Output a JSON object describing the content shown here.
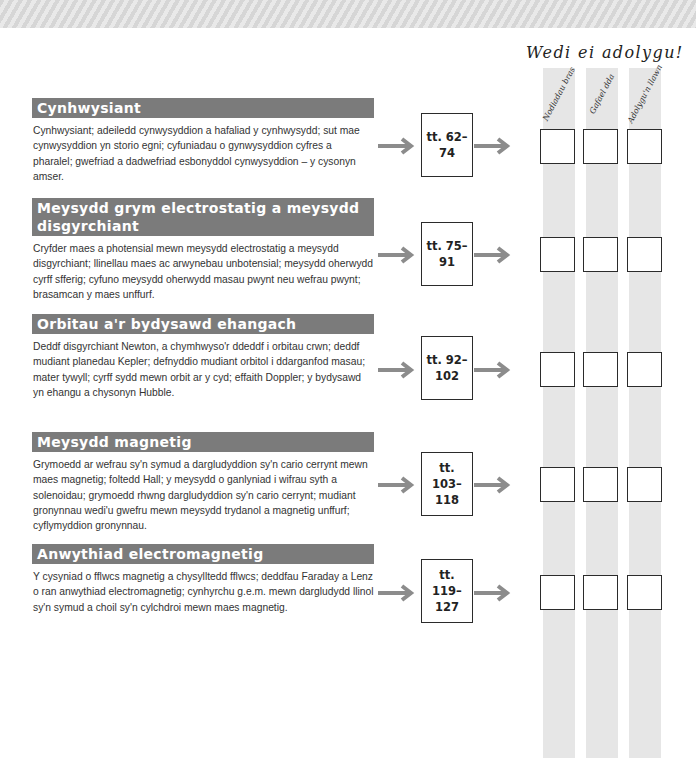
{
  "header": {
    "revised_title": "Wedi ei adolygu!",
    "columns": [
      {
        "label": "Nodiadau bras"
      },
      {
        "label": "Gafael dda"
      },
      {
        "label": "Adolygu'n llawn"
      }
    ]
  },
  "colors": {
    "section_header_bg": "#7b7b7b",
    "arrow": "#8c8c8c",
    "column_stripe": "#e6e6e6"
  },
  "sections": [
    {
      "title": "Cynhwysiant",
      "body": "Cynhwysiant; adeiledd cynwysyddion a hafaliad y cynhwysydd; sut mae cynwysyddion yn storio egni; cyfuniadau o gynwysyddion cyfres a pharalel; gwefriad a dadwefriad esbonyddol cynwysyddion – y cysonyn amser.",
      "pages": "tt. 62–74",
      "pages_line1": "tt. 62–",
      "pages_line2": "74"
    },
    {
      "title": "Meysydd grym electrostatig a meysydd disgyrchiant",
      "body": "Cryfder maes a photensial mewn meysydd electrostatig a meysydd disgyrchiant; llinellau maes ac arwynebau unbotensial; meysydd oherwydd cyrff sfferig; cyfuno meysydd oherwydd masau pwynt neu wefrau pwynt; brasamcan y maes unffurf.",
      "pages": "tt. 75–91",
      "pages_line1": "tt. 75–",
      "pages_line2": "91"
    },
    {
      "title": "Orbitau a'r bydysawd ehangach",
      "body": "Deddf disgyrchiant Newton, a chymhwyso'r ddeddf i orbitau crwn; deddf mudiant planedau Kepler; defnyddio mudiant orbitol i ddarganfod masau; mater tywyll; cyrff sydd mewn orbit ar y cyd; effaith Doppler; y bydysawd yn ehangu a chysonyn Hubble.",
      "pages": "tt. 92–102",
      "pages_line1": "tt. 92–",
      "pages_line2": "102"
    },
    {
      "title": "Meysydd magnetig",
      "body": "Grymoedd ar wefrau sy'n symud a dargludyddion sy'n cario cerrynt mewn maes magnetig; foltedd Hall; y meysydd o ganlyniad i wifrau syth a solenoidau; grymoedd rhwng dargludyddion sy'n cario cerrynt; mudiant gronynnau wedi'u gwefru mewn meysydd trydanol a magnetig unffurf; cyflymyddion gronynnau.",
      "pages": "tt. 103–118",
      "pages_line1": "tt. 103–",
      "pages_line2": "118"
    },
    {
      "title": "Anwythiad electromagnetig",
      "body": "Y cysyniad o fflwcs magnetig a chysylltedd fflwcs; deddfau Faraday a Lenz o ran anwythiad electromagnetig; cynhyrchu g.e.m. mewn dargludydd llinol sy'n symud a choil sy'n cylchdroi mewn maes magnetig.",
      "pages": "tt. 119–127",
      "pages_line1": "tt. 119–",
      "pages_line2": "127"
    }
  ]
}
